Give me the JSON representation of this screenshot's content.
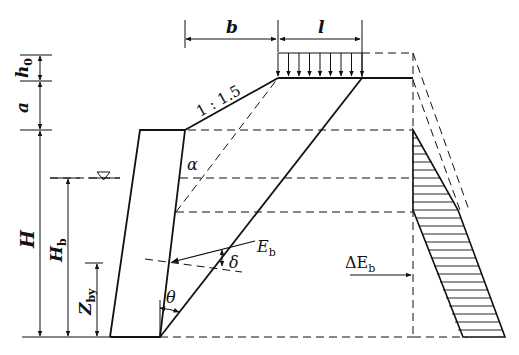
{
  "diagram": {
    "type": "retaining-wall-earth-pressure",
    "labels": {
      "b": "b",
      "l": "l",
      "h0_main": "h",
      "h0_sub": "0",
      "a": "a",
      "slope": "1 : 1.5",
      "alpha": "α",
      "H": "H",
      "Hb_main": "H",
      "Hb_sub": "b",
      "Zby_main": "Z",
      "Zby_sub": "by",
      "Eb_main": "E",
      "Eb_sub": "b",
      "delta": "δ",
      "theta": "θ",
      "dEb_main": "ΔE",
      "dEb_sub": "b",
      "water_level_symbol": "▽"
    },
    "colors": {
      "line": "#111111",
      "background": "#ffffff"
    },
    "uniform_load_arrow_count": 9
  }
}
